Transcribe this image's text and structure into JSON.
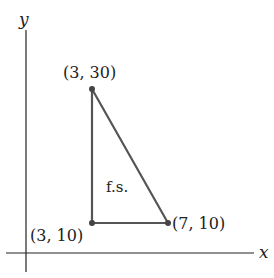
{
  "axes": {
    "x_label": "x",
    "y_label": "y"
  },
  "points": [
    {
      "label": "(3, 30)",
      "x": 3,
      "y": 30
    },
    {
      "label": "(3, 10)",
      "x": 3,
      "y": 10
    },
    {
      "label": "(7, 10)",
      "x": 7,
      "y": 10
    }
  ],
  "region_label": "f.s.",
  "colors": {
    "axis": "#222222",
    "triangle": "#555555"
  }
}
